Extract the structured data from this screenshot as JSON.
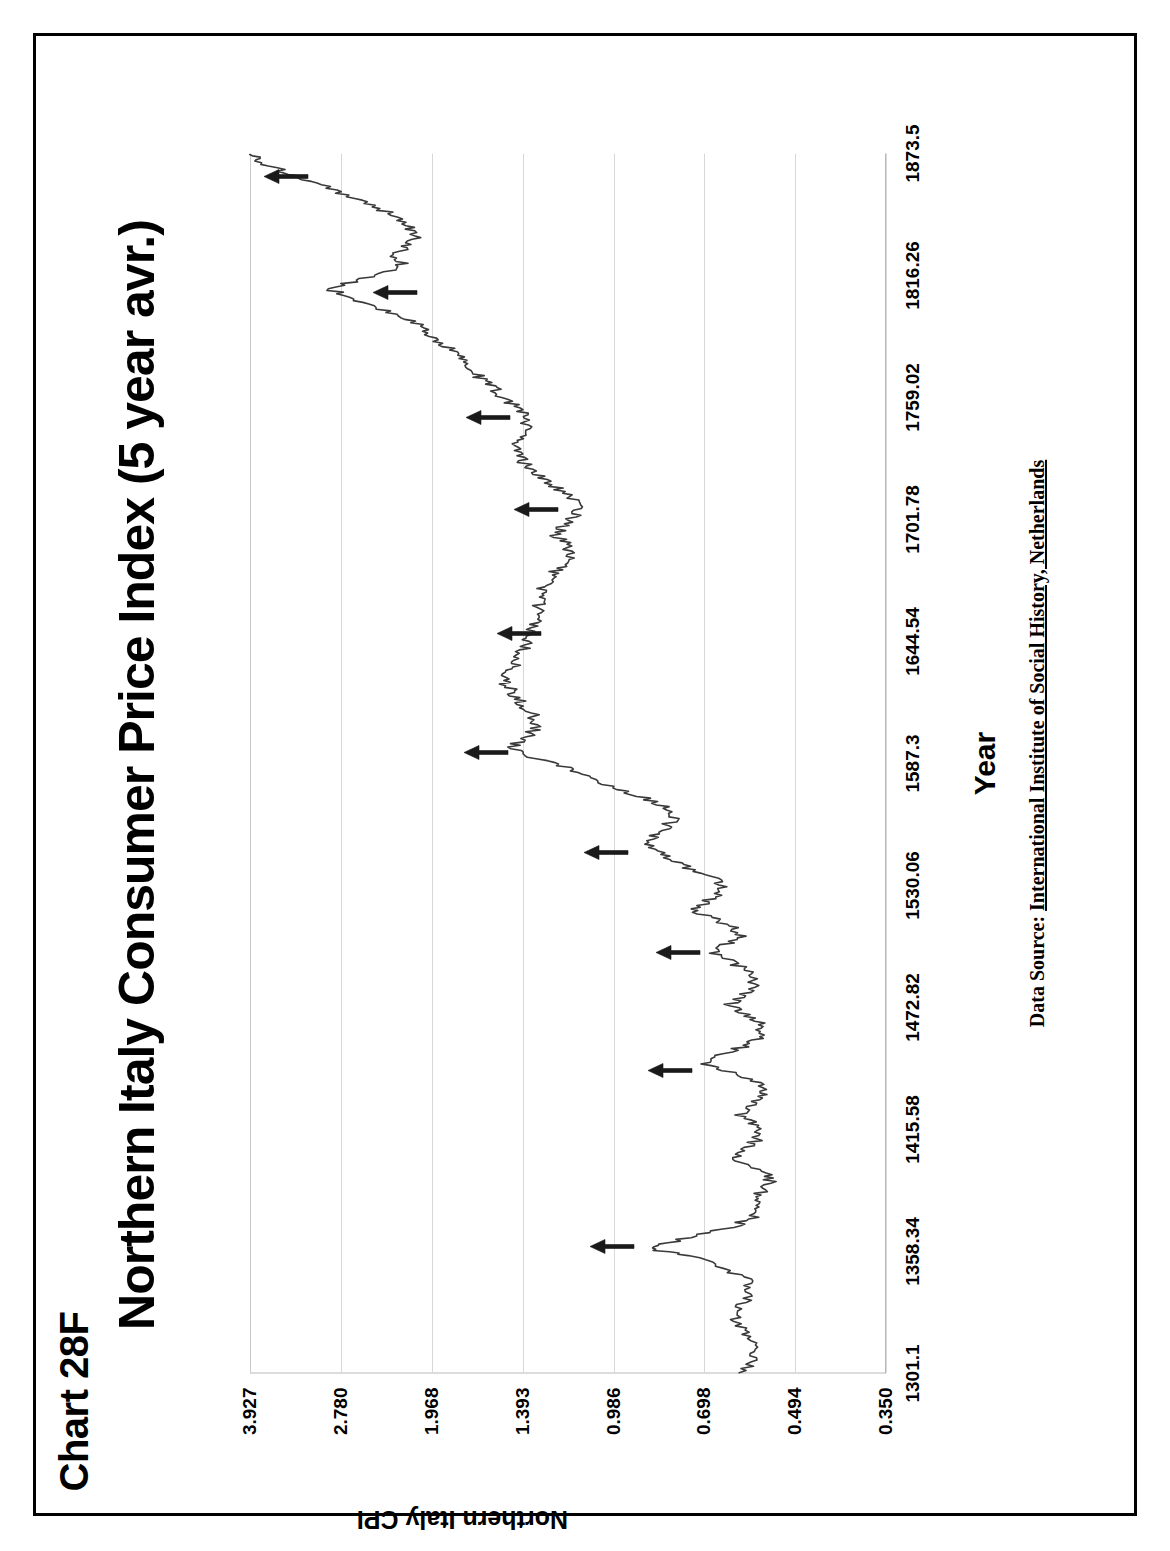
{
  "page": {
    "chart_label": "Chart 28F",
    "title": "Northern Italy Consumer Price Index (5 year avr.)",
    "data_source_prefix": "Data Source:",
    "data_source_value": "International Institute of Social History, Netherlands"
  },
  "chart_data": {
    "type": "line",
    "title": "Northern Italy Consumer Price Index (5 year avr.)",
    "subtitle": "Chart 28F",
    "xlabel": "Year",
    "ylabel": "Northern Italy CPI",
    "yscale": "log",
    "grid": "vertical-only-in-scan",
    "legend": "none",
    "xlim": [
      1301.1,
      1873.5
    ],
    "ylim": [
      0.35,
      3.927
    ],
    "xticks": [
      "1301.1",
      "1358.34",
      "1415.58",
      "1472.82",
      "1530.06",
      "1587.3",
      "1644.54",
      "1701.78",
      "1759.02",
      "1816.26",
      "1873.5"
    ],
    "yticks": [
      "0.350",
      "0.494",
      "0.698",
      "0.986",
      "1.393",
      "1.968",
      "2.780",
      "3.927"
    ],
    "series": [
      {
        "name": "Northern Italy CPI (5 year avr.)",
        "x": [
          1301,
          1306,
          1311,
          1316,
          1321,
          1326,
          1331,
          1336,
          1341,
          1346,
          1351,
          1356,
          1359,
          1362,
          1366,
          1370,
          1374,
          1378,
          1382,
          1386,
          1390,
          1394,
          1398,
          1402,
          1406,
          1410,
          1414,
          1418,
          1422,
          1426,
          1430,
          1434,
          1438,
          1442,
          1446,
          1450,
          1454,
          1458,
          1462,
          1466,
          1470,
          1474,
          1478,
          1482,
          1486,
          1490,
          1494,
          1498,
          1502,
          1506,
          1510,
          1514,
          1518,
          1522,
          1526,
          1530,
          1534,
          1538,
          1542,
          1546,
          1550,
          1554,
          1558,
          1562,
          1566,
          1570,
          1574,
          1578,
          1582,
          1586,
          1590,
          1594,
          1598,
          1602,
          1606,
          1610,
          1614,
          1618,
          1622,
          1626,
          1630,
          1634,
          1638,
          1642,
          1646,
          1650,
          1654,
          1658,
          1662,
          1666,
          1670,
          1674,
          1678,
          1682,
          1686,
          1690,
          1694,
          1698,
          1702,
          1706,
          1710,
          1714,
          1718,
          1722,
          1726,
          1730,
          1734,
          1738,
          1742,
          1746,
          1750,
          1754,
          1758,
          1762,
          1766,
          1770,
          1774,
          1778,
          1782,
          1786,
          1790,
          1794,
          1798,
          1802,
          1806,
          1810,
          1814,
          1818,
          1822,
          1826,
          1830,
          1834,
          1838,
          1842,
          1846,
          1850,
          1854,
          1858,
          1862,
          1866,
          1870,
          1873
        ],
        "y": [
          0.6,
          0.58,
          0.57,
          0.58,
          0.6,
          0.62,
          0.61,
          0.59,
          0.58,
          0.6,
          0.66,
          0.74,
          0.86,
          0.8,
          0.7,
          0.62,
          0.58,
          0.57,
          0.57,
          0.56,
          0.54,
          0.55,
          0.58,
          0.62,
          0.6,
          0.57,
          0.56,
          0.58,
          0.61,
          0.59,
          0.56,
          0.55,
          0.57,
          0.63,
          0.69,
          0.66,
          0.6,
          0.57,
          0.56,
          0.57,
          0.6,
          0.63,
          0.61,
          0.58,
          0.57,
          0.59,
          0.63,
          0.67,
          0.64,
          0.61,
          0.62,
          0.67,
          0.72,
          0.69,
          0.66,
          0.65,
          0.68,
          0.74,
          0.8,
          0.84,
          0.86,
          0.84,
          0.8,
          0.78,
          0.8,
          0.86,
          0.94,
          1.02,
          1.1,
          1.2,
          1.34,
          1.46,
          1.4,
          1.34,
          1.32,
          1.34,
          1.38,
          1.42,
          1.46,
          1.5,
          1.46,
          1.42,
          1.4,
          1.38,
          1.36,
          1.34,
          1.33,
          1.32,
          1.31,
          1.3,
          1.28,
          1.26,
          1.22,
          1.18,
          1.16,
          1.18,
          1.22,
          1.2,
          1.16,
          1.12,
          1.14,
          1.18,
          1.24,
          1.3,
          1.36,
          1.4,
          1.44,
          1.42,
          1.38,
          1.36,
          1.38,
          1.42,
          1.48,
          1.54,
          1.6,
          1.66,
          1.72,
          1.78,
          1.84,
          1.92,
          2.0,
          2.1,
          2.26,
          2.48,
          2.7,
          2.9,
          2.6,
          2.34,
          2.2,
          2.28,
          2.16,
          2.1,
          2.14,
          2.22,
          2.34,
          2.5,
          2.72,
          2.96,
          3.24,
          3.5,
          3.78,
          3.93
        ]
      }
    ],
    "annotations": [
      {
        "kind": "arrow",
        "label": "peak-marker-1",
        "x": 1360,
        "y": 0.9
      },
      {
        "kind": "arrow",
        "label": "peak-marker-2",
        "x": 1443,
        "y": 0.72
      },
      {
        "kind": "arrow",
        "label": "peak-marker-3",
        "x": 1498,
        "y": 0.7
      },
      {
        "kind": "arrow",
        "label": "peak-marker-4",
        "x": 1545,
        "y": 0.92
      },
      {
        "kind": "arrow",
        "label": "peak-marker-5",
        "x": 1592,
        "y": 1.45
      },
      {
        "kind": "arrow",
        "label": "peak-marker-6",
        "x": 1648,
        "y": 1.28
      },
      {
        "kind": "arrow",
        "label": "peak-marker-7",
        "x": 1706,
        "y": 1.2
      },
      {
        "kind": "arrow",
        "label": "peak-marker-8",
        "x": 1749,
        "y": 1.44
      },
      {
        "kind": "arrow",
        "label": "peak-marker-9",
        "x": 1808,
        "y": 2.05
      },
      {
        "kind": "arrow",
        "label": "peak-marker-10",
        "x": 1862,
        "y": 3.1
      }
    ]
  },
  "style": {
    "line_color": "#3a3a3a",
    "grid_color": "#d8d8d8",
    "axis_color": "#b9b9b9",
    "arrow_color": "#1a1a1a",
    "frame_color": "#000000",
    "background": "#ffffff"
  }
}
